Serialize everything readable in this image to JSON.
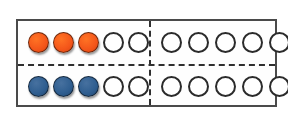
{
  "figure": {
    "name": "double-ten-frame",
    "rows": 2,
    "columns_per_row": 10,
    "group_size": 5,
    "frame_border_color": "#4a4a4a",
    "divider_color": "#2f2f2f",
    "background_color": "#ffffff",
    "empty_counter_outline_color": "#2b2b2b",
    "empty_counter_fill_color": "#ffffff"
  },
  "legend": {
    "orange_color": "#f4561a",
    "blue_color": "#2f5e90"
  },
  "chart_data": {
    "type": "table",
    "title": "",
    "rows": [
      {
        "label": "top-row",
        "counter_color": "orange",
        "color_hex": "#f4561a",
        "filled_count": 3,
        "empty_count": 7,
        "total": 10,
        "groups": [
          {
            "label": "left-group",
            "cells": [
              "filled",
              "filled",
              "filled",
              "empty",
              "empty"
            ]
          },
          {
            "label": "right-group",
            "cells": [
              "empty",
              "empty",
              "empty",
              "empty",
              "empty"
            ]
          }
        ]
      },
      {
        "label": "bottom-row",
        "counter_color": "blue",
        "color_hex": "#2f5e90",
        "filled_count": 3,
        "empty_count": 7,
        "total": 10,
        "groups": [
          {
            "label": "left-group",
            "cells": [
              "filled",
              "filled",
              "filled",
              "empty",
              "empty"
            ]
          },
          {
            "label": "right-group",
            "cells": [
              "empty",
              "empty",
              "empty",
              "empty",
              "empty"
            ]
          }
        ]
      }
    ]
  }
}
